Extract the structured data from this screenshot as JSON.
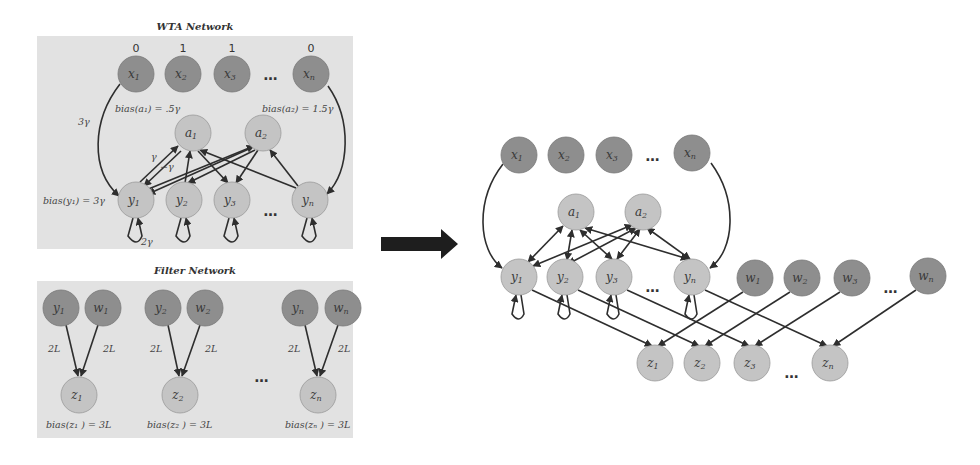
{
  "wta": {
    "title": "WTA Network",
    "inputs": [
      {
        "base": "x",
        "sub": "1",
        "value": "0"
      },
      {
        "base": "x",
        "sub": "2",
        "value": "1"
      },
      {
        "base": "x",
        "sub": "3",
        "value": "1"
      },
      {
        "base": "x",
        "sub": "n",
        "value": "0"
      }
    ],
    "aux": [
      {
        "base": "a",
        "sub": "1"
      },
      {
        "base": "a",
        "sub": "2"
      }
    ],
    "outputs": [
      {
        "base": "y",
        "sub": "1"
      },
      {
        "base": "y",
        "sub": "2"
      },
      {
        "base": "y",
        "sub": "3"
      },
      {
        "base": "y",
        "sub": "n"
      }
    ],
    "annotations": {
      "bias_a1": "bias(a₁) = .5γ",
      "bias_a2": "bias(a₂) = 1.5γ",
      "bias_y1": "bias(y₁) = 3γ",
      "input_weight": "3γ",
      "excite_weight": "γ",
      "inhibit_weight": "−γ",
      "self_weight": "2γ"
    },
    "ellipsis": "…"
  },
  "filter": {
    "title": "Filter Network",
    "groups": [
      {
        "y": {
          "base": "y",
          "sub": "1"
        },
        "w": {
          "base": "w",
          "sub": "1"
        },
        "z": {
          "base": "z",
          "sub": "1"
        },
        "wy": "2L",
        "ww": "2L",
        "bias": "bias(z₁ ) = 3L"
      },
      {
        "y": {
          "base": "y",
          "sub": "2"
        },
        "w": {
          "base": "w",
          "sub": "2"
        },
        "z": {
          "base": "z",
          "sub": "2"
        },
        "wy": "2L",
        "ww": "2L",
        "bias": "bias(z₂ ) = 3L"
      },
      {
        "y": {
          "base": "y",
          "sub": "n"
        },
        "w": {
          "base": "w",
          "sub": "n"
        },
        "z": {
          "base": "z",
          "sub": "n"
        },
        "wy": "2L",
        "ww": "2L",
        "bias": "bias(zₙ ) = 3L"
      }
    ],
    "ellipsis": "…"
  },
  "combined": {
    "inputs": [
      {
        "base": "x",
        "sub": "1"
      },
      {
        "base": "x",
        "sub": "2"
      },
      {
        "base": "x",
        "sub": "3"
      },
      {
        "base": "x",
        "sub": "n"
      }
    ],
    "aux": [
      {
        "base": "a",
        "sub": "1"
      },
      {
        "base": "a",
        "sub": "2"
      }
    ],
    "outputs": [
      {
        "base": "y",
        "sub": "1"
      },
      {
        "base": "y",
        "sub": "2"
      },
      {
        "base": "y",
        "sub": "3"
      },
      {
        "base": "y",
        "sub": "n"
      }
    ],
    "filters": [
      {
        "base": "w",
        "sub": "1"
      },
      {
        "base": "w",
        "sub": "2"
      },
      {
        "base": "w",
        "sub": "3"
      },
      {
        "base": "w",
        "sub": "n"
      }
    ],
    "results": [
      {
        "base": "z",
        "sub": "1"
      },
      {
        "base": "z",
        "sub": "2"
      },
      {
        "base": "z",
        "sub": "3"
      },
      {
        "base": "z",
        "sub": "n"
      }
    ],
    "ellipsis": "…"
  },
  "arrow": {
    "icon": "right-arrow-icon"
  },
  "colors": {
    "panel": "#e2e2e2",
    "node_dark": "#8e8e8e",
    "node_light": "#c4c4c4",
    "edge": "#2e2e2e"
  }
}
